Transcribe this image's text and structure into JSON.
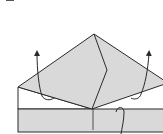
{
  "diagram": {
    "type": "origami-fold-step",
    "colors": {
      "paper_fill": "#d9d9d9",
      "paper_white": "#ffffff",
      "line": "#2a2a2a"
    },
    "elements": {
      "kite_flap": {
        "apex": [
          94,
          34
        ],
        "left": [
          18,
          87
        ],
        "right": [
          163,
          83
        ],
        "bottom": [
          92,
          109
        ]
      },
      "center_crease": [
        [
          94,
          34
        ],
        [
          107,
          70
        ],
        [
          92,
          109
        ]
      ],
      "base_strip": {
        "x": 18,
        "y": 109,
        "width": 145,
        "height": 23
      },
      "left_white_panel": {
        "x": 18,
        "top": 87,
        "bottom": 109
      },
      "arrows": [
        {
          "name": "left-unfold-arrow",
          "direction": "up"
        },
        {
          "name": "right-unfold-arrow",
          "direction": "up"
        },
        {
          "name": "bottom-tuck-arrow",
          "direction": "down"
        }
      ]
    }
  }
}
